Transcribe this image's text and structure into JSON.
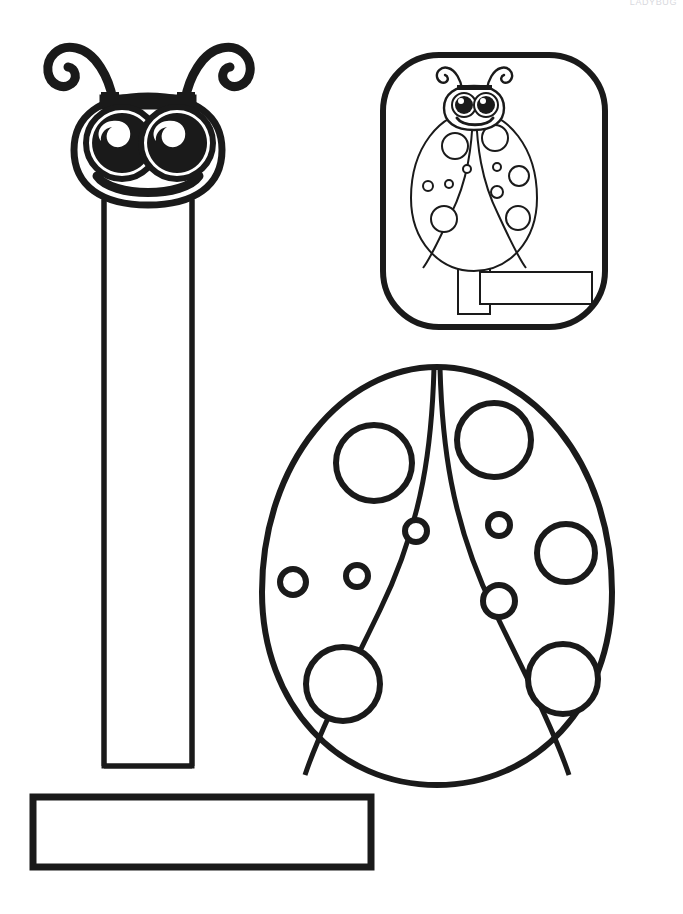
{
  "page": {
    "width": 683,
    "height": 914,
    "background_color": "#ffffff",
    "ink_color": "#1a1a1a",
    "header_faint_text": "LADYBUG"
  },
  "header": {
    "text": "LADYBUG",
    "color": "#d9d9de"
  },
  "pieces": {
    "head_piece": {
      "name": "Ladybug head with neck strip",
      "label": "ladybug-head-cutout",
      "head_center_x": 148,
      "head_center_y": 148,
      "head_width": 150,
      "head_height": 110,
      "antennae_count": 2,
      "eyes_count": 2,
      "has_smile": true
    },
    "neck_strip": {
      "name": "Vertical paper strip",
      "label": "vertical-strip",
      "x": 104,
      "y": 196,
      "width": 88,
      "height": 570
    },
    "handle_strip": {
      "name": "Horizontal handle strip",
      "label": "horizontal-strip",
      "x": 33,
      "y": 797,
      "width": 338,
      "height": 70
    },
    "body_piece": {
      "name": "Ladybug body with wings and spots",
      "label": "ladybug-body-cutout",
      "center_x": 437,
      "top_y": 365,
      "bottom_y": 785,
      "half_width": 180,
      "wing_count": 2,
      "spots_total": 10,
      "large_spots": 6,
      "small_spots": 4
    },
    "thumbnail": {
      "name": "Assembled example thumbnail",
      "label": "assembly-preview",
      "x": 383,
      "y": 55,
      "width": 222,
      "height": 272,
      "corner_radius": 56
    }
  },
  "spots": {
    "left_wing": [
      {
        "cx": 374,
        "cy": 463,
        "r": 38,
        "size": "large"
      },
      {
        "cx": 416,
        "cy": 531,
        "r": 11,
        "size": "small"
      },
      {
        "cx": 357,
        "cy": 576,
        "r": 11,
        "size": "small"
      },
      {
        "cx": 293,
        "cy": 582,
        "r": 13,
        "size": "small"
      },
      {
        "cx": 343,
        "cy": 684,
        "r": 37,
        "size": "large"
      }
    ],
    "right_wing": [
      {
        "cx": 494,
        "cy": 440,
        "r": 37,
        "size": "large"
      },
      {
        "cx": 499,
        "cy": 525,
        "r": 11,
        "size": "small"
      },
      {
        "cx": 566,
        "cy": 553,
        "r": 29,
        "size": "large"
      },
      {
        "cx": 499,
        "cy": 601,
        "r": 16,
        "size": "small"
      },
      {
        "cx": 563,
        "cy": 679,
        "r": 35,
        "size": "large"
      }
    ]
  },
  "thumbnail_spots": {
    "left_wing": [
      {
        "cx": 455,
        "cy": 146,
        "r": 13
      },
      {
        "cx": 467,
        "cy": 169,
        "r": 4
      },
      {
        "cx": 449,
        "cy": 184,
        "r": 4
      },
      {
        "cx": 428,
        "cy": 186,
        "r": 5
      },
      {
        "cx": 444,
        "cy": 219,
        "r": 13
      }
    ],
    "right_wing": [
      {
        "cx": 495,
        "cy": 138,
        "r": 13
      },
      {
        "cx": 497,
        "cy": 167,
        "r": 4
      },
      {
        "cx": 519,
        "cy": 176,
        "r": 10
      },
      {
        "cx": 497,
        "cy": 192,
        "r": 6
      },
      {
        "cx": 518,
        "cy": 218,
        "r": 12
      }
    ]
  }
}
